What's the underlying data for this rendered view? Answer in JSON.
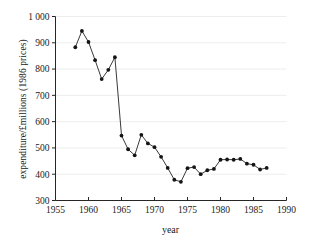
{
  "chart_data": {
    "type": "line",
    "title": "",
    "xlabel": "year",
    "ylabel": "expenditure/£millions (1986 prices)",
    "xlim": [
      1955,
      1990
    ],
    "ylim": [
      300,
      1000
    ],
    "xticks": [
      "1955",
      "1960",
      "1965",
      "1970",
      "1975",
      "1980",
      "1985",
      "1990"
    ],
    "xtick_values": [
      1955,
      1960,
      1965,
      1970,
      1975,
      1980,
      1985,
      1990
    ],
    "yticks": [
      "300",
      "400",
      "500",
      "600",
      "700",
      "800",
      "900",
      "1 000"
    ],
    "ytick_values": [
      300,
      400,
      500,
      600,
      700,
      800,
      900,
      1000
    ],
    "grid": "horizontal",
    "legend": "none",
    "marker": "filled-circle",
    "x": [
      1958,
      1959,
      1960,
      1961,
      1962,
      1963,
      1964,
      1965,
      1966,
      1967,
      1968,
      1969,
      1970,
      1971,
      1972,
      1973,
      1974,
      1975,
      1976,
      1977,
      1978,
      1979,
      1980,
      1981,
      1982,
      1983,
      1984,
      1985,
      1986,
      1987
    ],
    "values": [
      883,
      945,
      903,
      834,
      762,
      797,
      845,
      547,
      495,
      472,
      550,
      517,
      503,
      466,
      424,
      379,
      371,
      423,
      427,
      400,
      415,
      420,
      455,
      456,
      455,
      458,
      440,
      436,
      418,
      424
    ],
    "series": [
      {
        "name": "expenditure",
        "values": [
          883,
          945,
          903,
          834,
          762,
          797,
          845,
          547,
          495,
          472,
          550,
          517,
          503,
          466,
          424,
          379,
          371,
          423,
          427,
          400,
          415,
          420,
          455,
          456,
          455,
          458,
          440,
          436,
          418,
          424
        ]
      }
    ],
    "colors": {
      "line": "#3a3a3a",
      "marker": "#141414",
      "grid": "#ededed",
      "axis": "#262626",
      "background": "#ffffff"
    }
  }
}
